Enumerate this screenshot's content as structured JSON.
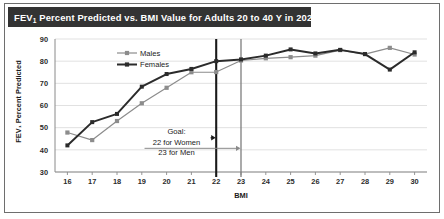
{
  "figure": {
    "title_prefix": "FEV",
    "title_sub": "1",
    "title_rest": " Percent Predicted vs. BMI Value for Adults 20 to 40 Y in 2020"
  },
  "legend": {
    "position": "upper-left-inside",
    "entries": [
      {
        "name": "males-legend",
        "label": "Males",
        "color": "#8c8c8c",
        "marker": "square"
      },
      {
        "name": "females-legend",
        "label": "Females",
        "color": "#2b2b2b",
        "marker": "square"
      }
    ]
  },
  "annotation": {
    "line1": "Goal:",
    "line2": "22 for Women",
    "line3": "23 for Men"
  },
  "chart_data": {
    "type": "line",
    "title": "FEV1 Percent Predicted vs. BMI Value for Adults 20 to 40 Y in 2020",
    "xlabel": "BMI",
    "ylabel": "FEV₁ Percent Predicted",
    "x": [
      16,
      17,
      18,
      19,
      20,
      21,
      22,
      23,
      24,
      25,
      26,
      27,
      28,
      29,
      30
    ],
    "xtick_labels": [
      "16",
      "17",
      "18",
      "19",
      "20",
      "21",
      "22",
      "23",
      "24",
      "25",
      "26",
      "27",
      "28",
      "29",
      "30"
    ],
    "ytick_labels": [
      "30",
      "40",
      "50",
      "60",
      "70",
      "80",
      "90"
    ],
    "yticks": [
      30,
      40,
      50,
      60,
      70,
      80,
      90
    ],
    "xlim": [
      15.5,
      30.5
    ],
    "ylim": [
      30,
      90
    ],
    "grid": "horizontal",
    "series": [
      {
        "name": "Males",
        "color": "#8c8c8c",
        "marker": "square",
        "values": [
          47.8,
          44.4,
          53.0,
          61.0,
          68.0,
          75.0,
          75.1,
          80.3,
          81.3,
          81.8,
          82.5,
          85.0,
          83.2,
          86.0,
          83.0
        ]
      },
      {
        "name": "Females",
        "color": "#2b2b2b",
        "marker": "square",
        "values": [
          42.0,
          52.5,
          56.2,
          68.5,
          74.2,
          76.5,
          80.0,
          80.8,
          82.5,
          85.3,
          83.5,
          85.1,
          83.2,
          76.2,
          84.0
        ]
      }
    ],
    "reference_lines": [
      {
        "name": "goal-line-women",
        "x": 22,
        "color": "#1a1a1a",
        "width": 2.1,
        "label": "22 for Women"
      },
      {
        "name": "goal-line-men",
        "x": 23,
        "color": "#7d7d7d",
        "width": 1.3,
        "label": "23 for Men"
      }
    ],
    "annotations": [
      {
        "name": "goal-annotation",
        "text": "Goal:\n22 for Women\n23 for Men",
        "x": 20.4,
        "y": 47
      }
    ]
  }
}
